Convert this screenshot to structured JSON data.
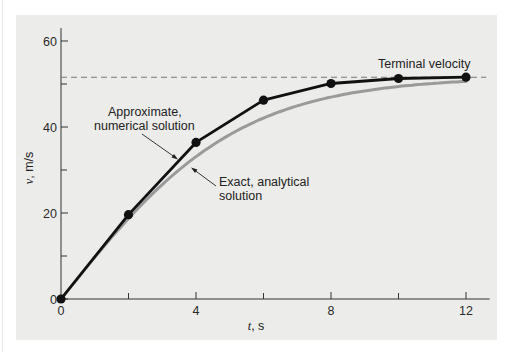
{
  "chart_data": {
    "type": "line",
    "title": "",
    "xlabel": "t, s",
    "ylabel": "v, m/s",
    "xlim": [
      0,
      12.6
    ],
    "ylim": [
      0,
      63
    ],
    "x_ticks": [
      0,
      4,
      8,
      12
    ],
    "x_minor_ticks": [
      2,
      6,
      10
    ],
    "y_ticks": [
      0,
      20,
      40,
      60
    ],
    "y_minor_ticks": [
      10,
      30,
      50
    ],
    "x_tick_labels": [
      "0",
      "4",
      "8",
      "12"
    ],
    "y_tick_labels": [
      "0",
      "20",
      "40",
      "60"
    ],
    "grid": false,
    "legend": null,
    "x": [
      0,
      2,
      4,
      6,
      8,
      10,
      12
    ],
    "series": [
      {
        "name": "Approximate, numerical solution",
        "style": "black line with circular markers",
        "color": "#111111",
        "values": [
          0,
          19.62,
          36.41,
          46.24,
          50.12,
          51.28,
          51.59
        ]
      },
      {
        "name": "Exact, analytical solution",
        "style": "gray smooth curve",
        "color": "#9a9a9a",
        "values": [
          0,
          18.73,
          33.12,
          42.07,
          46.99,
          49.42,
          50.56
        ]
      }
    ],
    "reference_lines": [
      {
        "name": "Terminal velocity",
        "orientation": "horizontal",
        "value": 51.69,
        "style": "dashed",
        "color": "#777777"
      }
    ],
    "annotations": [
      {
        "text": "Terminal velocity",
        "points_to": "dashed line at terminal velocity"
      },
      {
        "text": "Approximate,\nnumerical solution",
        "points_to": "numerical curve near t=3.5"
      },
      {
        "text": "Exact, analytical\nsolution",
        "points_to": "exact curve near t=3.9"
      }
    ]
  },
  "labels": {
    "terminal": "Terminal velocity",
    "approx_line1": "Approximate,",
    "approx_line2": "numerical solution",
    "exact_line1": "Exact, analytical",
    "exact_line2": "solution",
    "xlabel_var": "t",
    "xlabel_unit": ", s",
    "ylabel_var": "v",
    "ylabel_unit": ", m/s"
  },
  "colors": {
    "panel": "#ececea",
    "numerical": "#111111",
    "exact": "#9a9a9a",
    "dashed": "#777777",
    "axis": "#333333"
  }
}
